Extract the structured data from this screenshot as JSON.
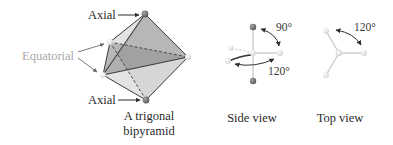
{
  "figure": {
    "labels": {
      "axial_top": "Axial",
      "axial_bottom": "Axial",
      "equatorial": "Equatorial"
    },
    "captions": {
      "bipyramid_line1": "A trigonal",
      "bipyramid_line2": "bipyramid",
      "side_view": "Side view",
      "top_view": "Top view"
    },
    "angles": {
      "side_axial_equatorial": "90°",
      "side_equatorial": "120°",
      "top_equatorial": "120°"
    },
    "colors": {
      "axial_atom": "#6e6e6e",
      "equatorial_atom": "#ececec",
      "face_dark": "#9d9d9d",
      "face_light": "#dcdcdc",
      "edge": "#3c3c3c",
      "bond": "#c8c8c8",
      "arrow": "#2f2f2f",
      "equatorial_label": "#a8a8a8"
    }
  }
}
